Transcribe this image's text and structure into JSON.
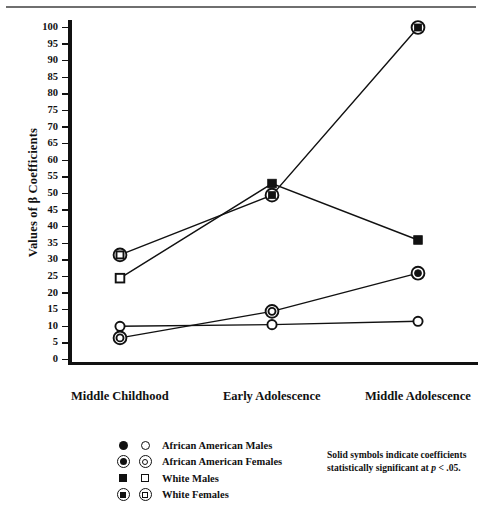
{
  "chart_data": {
    "type": "line",
    "title": "",
    "xlabel": "",
    "ylabel": "Values of β Coefficients",
    "ylim": [
      0,
      100
    ],
    "ytick_step": 5,
    "yticks": [
      0,
      5,
      10,
      15,
      20,
      25,
      30,
      35,
      40,
      45,
      50,
      55,
      60,
      65,
      70,
      75,
      80,
      85,
      90,
      95,
      100
    ],
    "grid": false,
    "legend_position": "bottom-left",
    "categories": [
      "Middle Childhood",
      "Early Adolescence",
      "Middle Adolescence"
    ],
    "series": [
      {
        "name": "African American Males",
        "symbol": "circle",
        "values": [
          10.0,
          10.5,
          11.5
        ],
        "significant": [
          false,
          false,
          false
        ]
      },
      {
        "name": "African American Females",
        "symbol": "circle-in-circle",
        "values": [
          6.5,
          14.5,
          26.0
        ],
        "significant": [
          false,
          false,
          true
        ]
      },
      {
        "name": "White Males",
        "symbol": "square",
        "values": [
          24.5,
          53.0,
          36.0
        ],
        "significant": [
          false,
          true,
          true
        ]
      },
      {
        "name": "White Females",
        "symbol": "square-in-circle",
        "values": [
          31.5,
          49.5,
          100.0
        ],
        "significant": [
          false,
          true,
          true
        ]
      }
    ],
    "annotations": [
      "Solid symbols indicate coefficients statistically significant at p < .05."
    ]
  },
  "axis": {
    "y_title": "Values of β Coefficients",
    "tick_labels": [
      "100",
      "95",
      "90",
      "85",
      "80",
      "75",
      "70",
      "65",
      "60",
      "55",
      "50",
      "45",
      "40",
      "35",
      "30",
      "25",
      "20",
      "15",
      "10",
      "5",
      "0"
    ],
    "x_labels": [
      "Middle Childhood",
      "Early Adolescence",
      "Middle Adolescence"
    ]
  },
  "legend": {
    "items": [
      {
        "label": "African American Males",
        "filled_symbol": "filled-circle",
        "open_symbol": "open-circle"
      },
      {
        "label": "African American Females",
        "filled_symbol": "filled-circle-in-circle",
        "open_symbol": "open-circle-in-circle"
      },
      {
        "label": "White Males",
        "filled_symbol": "filled-square",
        "open_symbol": "open-square"
      },
      {
        "label": "White Females",
        "filled_symbol": "filled-square-in-circle",
        "open_symbol": "open-square-in-circle"
      }
    ]
  },
  "note": {
    "line1": "Solid symbols indicate coefficients",
    "line2_pre": "statistically significant at ",
    "line2_italic": "p",
    "line2_post": " < .05."
  },
  "colors": {
    "ink": "#111111",
    "rule": "#6f6f6f",
    "background": "#ffffff"
  }
}
